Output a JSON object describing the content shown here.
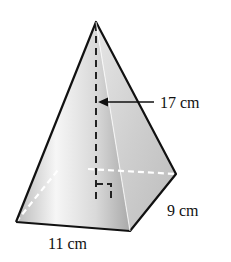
{
  "figure": {
    "type": "square-based pyramid (rectangular base)",
    "labels": {
      "height": "17 cm",
      "depth": "9 cm",
      "width": "11 cm"
    },
    "colors": {
      "edge": "#111111",
      "hidden_edge": "#ffffff",
      "height_line": "#222222",
      "face_light": "#f4f4f4",
      "face_mid": "#c8c8c8",
      "face_dark": "#a8a8a8"
    }
  }
}
